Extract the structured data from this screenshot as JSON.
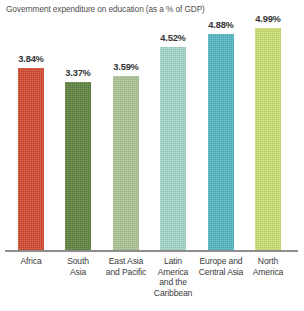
{
  "chart_data": {
    "type": "bar",
    "title": "Government expenditure on education (as a % of GDP)",
    "xlabel": "",
    "ylabel": "",
    "ylim": [
      3.0,
      5.1
    ],
    "grid": false,
    "legend": "none",
    "value_suffix": "%",
    "axis_note": "truncated vertical axis (bars do not start at zero)",
    "categories": [
      "Africa",
      "South Asia",
      "East Asia and Pacific",
      "Latin America and the Caribbean",
      "Europe and Central Asia",
      "North America"
    ],
    "values": [
      3.84,
      3.37,
      3.59,
      4.52,
      4.88,
      4.99
    ],
    "value_labels": [
      "3.84%",
      "3.37%",
      "3.59%",
      "4.52%",
      "4.88%",
      "4.99%"
    ],
    "bar_colors": [
      "#d1452a",
      "#5a8039",
      "#a8c191",
      "#9fd3c5",
      "#4fb5c2",
      "#c6dc6d"
    ],
    "bars": [
      {
        "category": "Africa",
        "label_lines": [
          "Africa"
        ],
        "value": 3.84,
        "value_label": "3.84%",
        "color": "#d1452a",
        "px_left": 18,
        "px_width": 26,
        "px_top": 68
      },
      {
        "category": "South Asia",
        "label_lines": [
          "South",
          "Asia"
        ],
        "value": 3.37,
        "value_label": "3.37%",
        "color": "#5a8039",
        "px_left": 65,
        "px_width": 26,
        "px_top": 82
      },
      {
        "category": "East Asia and Pacific",
        "label_lines": [
          "East Asia",
          "and Pacific"
        ],
        "value": 3.59,
        "value_label": "3.59%",
        "color": "#a8c191",
        "px_left": 113,
        "px_width": 26,
        "px_top": 76
      },
      {
        "category": "Latin America and the Caribbean",
        "label_lines": [
          "Latin",
          "America",
          "and the",
          "Caribbean"
        ],
        "value": 4.52,
        "value_label": "4.52%",
        "color": "#9fd3c5",
        "px_left": 160,
        "px_width": 26,
        "px_top": 47
      },
      {
        "category": "Europe and Central Asia",
        "label_lines": [
          "Europe and",
          "Central Asia"
        ],
        "value": 4.88,
        "value_label": "4.88%",
        "color": "#4fb5c2",
        "px_left": 208,
        "px_width": 26,
        "px_top": 34
      },
      {
        "category": "North America",
        "label_lines": [
          "North",
          "America"
        ],
        "value": 4.99,
        "value_label": "4.99%",
        "color": "#c6dc6d",
        "px_left": 255,
        "px_width": 26,
        "px_top": 28
      }
    ]
  },
  "axis": {
    "baseline_color": "#8e8e8e"
  }
}
